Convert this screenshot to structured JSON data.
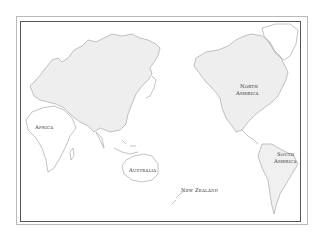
{
  "map": {
    "type": "world outline map (Pacific-centred)",
    "colors": {
      "land_outline": "#9a9a9a",
      "shaded_region": "#ececec",
      "frame": "#555555",
      "background": "#ffffff"
    },
    "labels": {
      "africa": "Africa",
      "north_america_1": "North",
      "north_america_2": "America",
      "australia": "Australia",
      "new_zealand": "New Zealand",
      "south_america_1": "South",
      "south_america_2": "America"
    }
  }
}
